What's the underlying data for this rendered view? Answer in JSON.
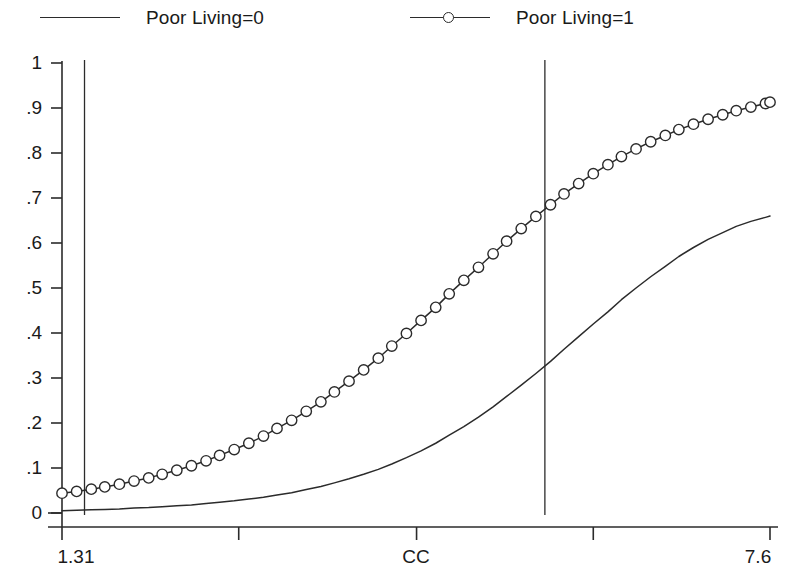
{
  "legend": {
    "position": "top",
    "entries": [
      {
        "label": "Poor Living=0",
        "marker": "none",
        "line": "solid"
      },
      {
        "label": "Poor Living=1",
        "marker": "circle-open",
        "line": "solid"
      }
    ]
  },
  "chart_data": {
    "type": "line",
    "title": "",
    "subtitle": "",
    "xlabel": "CC",
    "ylabel": "",
    "xlim": [
      1.31,
      7.6
    ],
    "ylim": [
      0,
      1
    ],
    "grid": false,
    "legend_position": "top",
    "xticks": [
      1.31,
      2.88,
      4.46,
      6.03,
      7.6
    ],
    "xticklabels": [
      "1.31",
      "",
      "",
      "",
      "7.6"
    ],
    "yticks": [
      0,
      0.1,
      0.2,
      0.3,
      0.4,
      0.5,
      0.6,
      0.7,
      0.8,
      0.9,
      1
    ],
    "yticklabels": [
      "0",
      ".1",
      ".2",
      ".3",
      ".4",
      ".5",
      ".6",
      ".7",
      ".8",
      ".9",
      "1"
    ],
    "annotations": [
      {
        "type": "vline",
        "x": 1.51,
        "label": ""
      },
      {
        "type": "vline",
        "x": 5.6,
        "label": ""
      },
      {
        "type": "vline",
        "x": 9.1,
        "label": ""
      }
    ],
    "vlines_x": [
      1.51,
      5.6,
      9.1
    ],
    "series": [
      {
        "name": "Poor Living=0",
        "marker": "none",
        "x": [
          1.31,
          1.44,
          1.57,
          1.69,
          1.82,
          1.95,
          2.08,
          2.2,
          2.33,
          2.46,
          2.59,
          2.71,
          2.84,
          2.97,
          3.1,
          3.22,
          3.35,
          3.48,
          3.61,
          3.73,
          3.86,
          3.99,
          4.12,
          4.24,
          4.37,
          4.5,
          4.63,
          4.75,
          4.88,
          5.01,
          5.14,
          5.26,
          5.39,
          5.52,
          5.65,
          5.77,
          5.9,
          6.03,
          6.16,
          6.28,
          6.41,
          6.54,
          6.67,
          6.79,
          6.92,
          7.05,
          7.18,
          7.3,
          7.43,
          7.56,
          7.6
        ],
        "y": [
          0.005,
          0.006,
          0.007,
          0.008,
          0.009,
          0.011,
          0.012,
          0.014,
          0.016,
          0.018,
          0.021,
          0.024,
          0.027,
          0.031,
          0.035,
          0.04,
          0.045,
          0.052,
          0.059,
          0.067,
          0.076,
          0.086,
          0.097,
          0.109,
          0.123,
          0.138,
          0.155,
          0.173,
          0.192,
          0.213,
          0.236,
          0.259,
          0.284,
          0.31,
          0.337,
          0.364,
          0.392,
          0.42,
          0.447,
          0.474,
          0.5,
          0.525,
          0.548,
          0.57,
          0.59,
          0.608,
          0.623,
          0.637,
          0.648,
          0.657,
          0.66
        ]
      },
      {
        "name": "Poor Living=1",
        "marker": "circle-open",
        "x": [
          1.31,
          1.44,
          1.57,
          1.69,
          1.82,
          1.95,
          2.08,
          2.2,
          2.33,
          2.46,
          2.59,
          2.71,
          2.84,
          2.97,
          3.1,
          3.22,
          3.35,
          3.48,
          3.61,
          3.73,
          3.86,
          3.99,
          4.12,
          4.24,
          4.37,
          4.5,
          4.63,
          4.75,
          4.88,
          5.01,
          5.14,
          5.26,
          5.39,
          5.52,
          5.65,
          5.77,
          5.9,
          6.03,
          6.16,
          6.28,
          6.41,
          6.54,
          6.67,
          6.79,
          6.92,
          7.05,
          7.18,
          7.3,
          7.43,
          7.56,
          7.6
        ],
        "y": [
          0.044,
          0.048,
          0.053,
          0.058,
          0.064,
          0.071,
          0.078,
          0.086,
          0.095,
          0.105,
          0.116,
          0.128,
          0.141,
          0.155,
          0.171,
          0.188,
          0.206,
          0.226,
          0.247,
          0.269,
          0.293,
          0.318,
          0.344,
          0.371,
          0.399,
          0.428,
          0.457,
          0.487,
          0.517,
          0.546,
          0.576,
          0.604,
          0.632,
          0.659,
          0.685,
          0.709,
          0.732,
          0.754,
          0.774,
          0.792,
          0.809,
          0.825,
          0.839,
          0.852,
          0.864,
          0.875,
          0.885,
          0.894,
          0.902,
          0.91,
          0.913
        ]
      }
    ]
  },
  "style": {
    "axis_color": "#2b2b2b",
    "line_color": "#2b2b2b",
    "background": "#ffffff",
    "marker_fill": "#ffffff"
  }
}
